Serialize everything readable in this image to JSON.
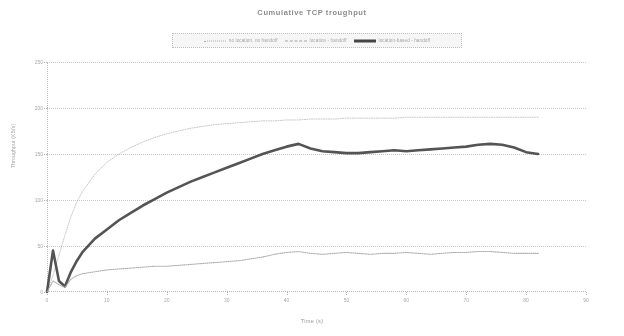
{
  "chart_data": {
    "type": "line",
    "title": "Cumulative TCP troughput",
    "xlabel": "Time (s)",
    "ylabel": "Throughput (KB/s)",
    "xlim": [
      0,
      90
    ],
    "ylim": [
      0,
      250
    ],
    "xticks": [
      0,
      10,
      20,
      30,
      40,
      50,
      60,
      70,
      80,
      90
    ],
    "xtick_labels": [
      "0",
      "10",
      "20",
      "30",
      "40",
      "50",
      "60",
      "70",
      "80",
      "90"
    ],
    "yticks": [
      0,
      50,
      100,
      150,
      200,
      250
    ],
    "ytick_labels": [
      "0",
      "50",
      "100",
      "150",
      "200",
      "250"
    ],
    "grid": "horizontal-dotted",
    "legend_position": "top-center",
    "x": [
      0,
      1,
      2,
      3,
      4,
      5,
      6,
      8,
      10,
      12,
      14,
      16,
      18,
      20,
      22,
      24,
      26,
      28,
      30,
      32,
      34,
      36,
      38,
      40,
      42,
      44,
      46,
      48,
      50,
      52,
      54,
      56,
      58,
      60,
      62,
      64,
      66,
      68,
      70,
      72,
      74,
      76,
      78,
      80,
      82
    ],
    "series": [
      {
        "name": "no location, no handoff",
        "style": "dotted",
        "color": "#b0b0b0",
        "values": [
          0,
          18,
          40,
          62,
          82,
          98,
          110,
          128,
          141,
          150,
          157,
          163,
          168,
          172,
          175,
          178,
          180,
          182,
          183,
          184,
          185,
          186,
          186,
          187,
          187,
          188,
          188,
          188,
          189,
          189,
          189,
          189,
          189,
          190,
          190,
          190,
          190,
          190,
          190,
          190,
          190,
          190,
          190,
          190,
          190
        ]
      },
      {
        "name": "location - handoff",
        "style": "solid-thick",
        "color": "#303030",
        "values": [
          0,
          45,
          12,
          6,
          22,
          34,
          44,
          58,
          68,
          78,
          86,
          94,
          101,
          108,
          114,
          120,
          125,
          130,
          135,
          140,
          145,
          150,
          154,
          158,
          161,
          156,
          153,
          152,
          151,
          151,
          152,
          153,
          154,
          153,
          154,
          155,
          156,
          157,
          158,
          160,
          161,
          160,
          157,
          152,
          150
        ]
      },
      {
        "name": "location-based - handoff",
        "style": "dotted-dark",
        "color": "#9e9e9e",
        "values": [
          0,
          12,
          8,
          5,
          14,
          18,
          20,
          22,
          24,
          25,
          26,
          27,
          28,
          28,
          29,
          30,
          31,
          32,
          33,
          34,
          36,
          38,
          41,
          43,
          44,
          42,
          41,
          42,
          43,
          42,
          41,
          42,
          42,
          43,
          42,
          41,
          42,
          43,
          43,
          44,
          44,
          43,
          42,
          42,
          42
        ]
      }
    ]
  },
  "legend": {
    "entries": [
      {
        "label": "no location, no handoff",
        "swatch": "dotted-line-swatch"
      },
      {
        "label": "location - handoff",
        "swatch": "dashed-line-swatch"
      },
      {
        "label": "location-based - handoff",
        "swatch": "solid-line-swatch"
      }
    ]
  }
}
